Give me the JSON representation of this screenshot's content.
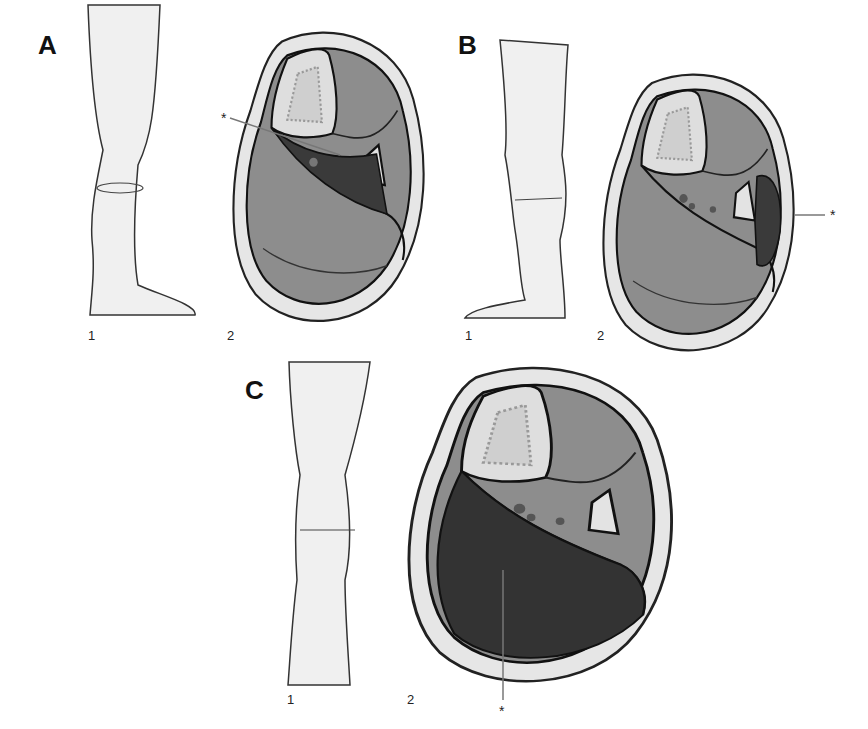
{
  "figure": {
    "panels": [
      {
        "letter": "A",
        "leg_label": "1",
        "section_label": "2",
        "marker": "*",
        "highlighted_compartment": "deep posterior"
      },
      {
        "letter": "B",
        "leg_label": "1",
        "section_label": "2",
        "marker": "*",
        "highlighted_compartment": "lateral"
      },
      {
        "letter": "C",
        "leg_label": "1",
        "section_label": "2",
        "marker": "*",
        "highlighted_compartment": "superficial posterior"
      }
    ],
    "colors": {
      "skin": "#e8e8e8",
      "muscle": "#8c8c8c",
      "highlight": "#3a3a3a",
      "bone": "#dcdcdc",
      "outline": "#1a1a1a"
    }
  }
}
